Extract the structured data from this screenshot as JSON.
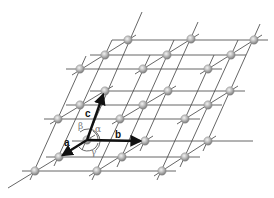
{
  "diagram": {
    "colors": {
      "background": "#ffffff",
      "lattice_line": "#444444",
      "atom_fill": "#b8b8b8",
      "vector": "#111111",
      "angle_arc": "#555555"
    },
    "vectors": [
      {
        "name": "a",
        "label": "a"
      },
      {
        "name": "b",
        "label": "b"
      },
      {
        "name": "c",
        "label": "c"
      }
    ],
    "angles": [
      {
        "name": "alpha",
        "label": "α"
      },
      {
        "name": "beta",
        "label": "β"
      },
      {
        "name": "gamma",
        "label": "γ"
      }
    ],
    "lattice": {
      "size": "3x3x3",
      "node_count": 27
    }
  }
}
